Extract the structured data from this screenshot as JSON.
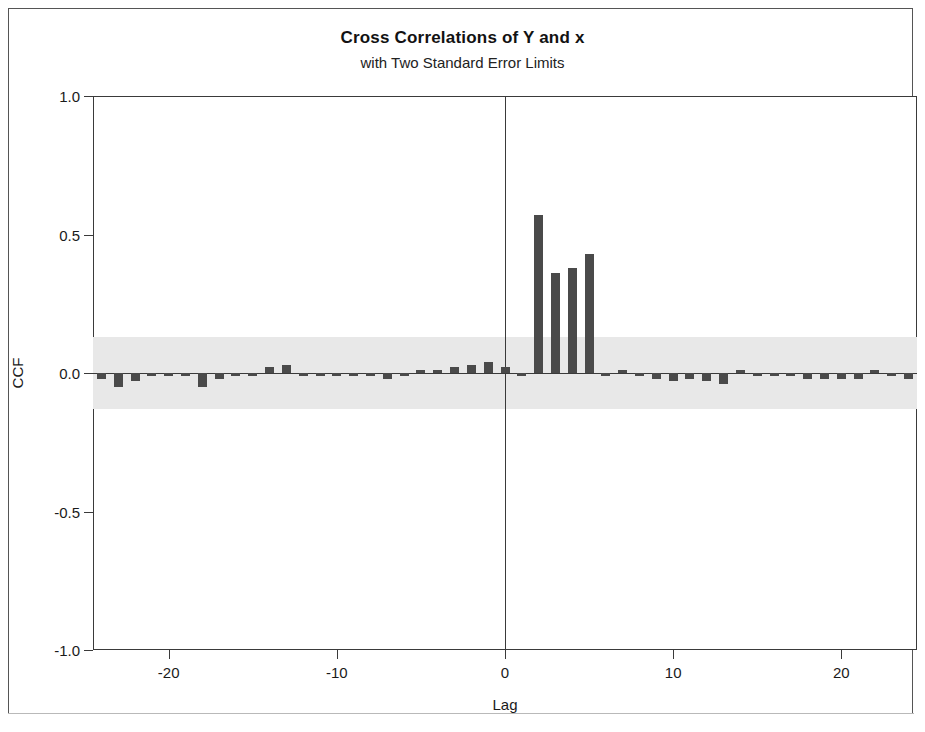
{
  "chart_data": {
    "type": "bar",
    "title": "Cross Correlations of Y and x",
    "subtitle": "with Two Standard Error Limits",
    "xlabel": "Lag",
    "ylabel": "CCF",
    "xlim": [
      -24.5,
      24.5
    ],
    "ylim": [
      -1.0,
      1.0
    ],
    "xticks": [
      -20,
      -10,
      0,
      10,
      20
    ],
    "xtick_labels": [
      "-20",
      "-10",
      "0",
      "10",
      "20"
    ],
    "yticks": [
      1.0,
      0.5,
      0.0,
      -0.5,
      -1.0
    ],
    "ytick_labels": [
      "1.0",
      "0.5",
      "0.0",
      "-0.5",
      "-1.0"
    ],
    "grid": false,
    "legend": null,
    "reference_lines": {
      "zero_horizontal": 0.0,
      "zero_vertical_lag": 0
    },
    "significance_band": {
      "label": "Two Standard Error Limits",
      "upper": 0.13,
      "lower": -0.13,
      "color": "#e8e8e8"
    },
    "bar_color": "#4a4a4a",
    "categories": [
      -24,
      -23,
      -22,
      -21,
      -20,
      -19,
      -18,
      -17,
      -16,
      -15,
      -14,
      -13,
      -12,
      -11,
      -10,
      -9,
      -8,
      -7,
      -6,
      -5,
      -4,
      -3,
      -2,
      -1,
      0,
      1,
      2,
      3,
      4,
      5,
      6,
      7,
      8,
      9,
      10,
      11,
      12,
      13,
      14,
      15,
      16,
      17,
      18,
      19,
      20,
      21,
      22,
      23,
      24
    ],
    "values": [
      -0.02,
      -0.05,
      -0.03,
      -0.01,
      -0.01,
      -0.01,
      -0.05,
      -0.02,
      -0.01,
      -0.01,
      0.02,
      0.03,
      -0.01,
      -0.01,
      -0.01,
      -0.01,
      -0.01,
      -0.02,
      -0.01,
      0.01,
      0.01,
      0.02,
      0.03,
      0.04,
      0.02,
      -0.01,
      0.57,
      0.36,
      0.38,
      0.43,
      -0.01,
      0.01,
      -0.01,
      -0.02,
      -0.03,
      -0.02,
      -0.03,
      -0.04,
      0.01,
      -0.01,
      -0.01,
      -0.01,
      -0.02,
      -0.02,
      -0.02,
      -0.02,
      0.01,
      -0.01,
      -0.02
    ]
  }
}
